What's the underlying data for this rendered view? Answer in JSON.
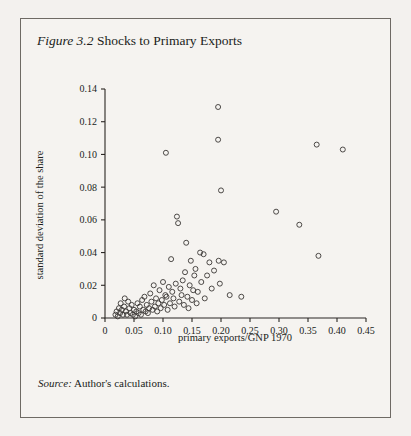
{
  "page": {
    "running_head": "",
    "background_color": "#f3f1ee"
  },
  "figure": {
    "number_label": "Figure 3.2",
    "caption": "Shocks to Primary Exports",
    "source_label": "Source:",
    "source_text": "Author's calculations.",
    "border_color": "#6e6a64",
    "panel_color": "#f5f3f0"
  },
  "chart_data": {
    "type": "scatter",
    "title": "Shocks to Primary Exports",
    "xlabel": "primary exports/GNP 1970",
    "ylabel": "standard deviation of the share",
    "xlim": [
      0,
      0.45
    ],
    "ylim": [
      0,
      0.14
    ],
    "xticks": [
      0,
      0.05,
      0.1,
      0.15,
      0.2,
      0.25,
      0.3,
      0.35,
      0.4,
      0.45
    ],
    "xtick_labels": [
      "0",
      "0.05",
      "0.10",
      "0.15",
      "0.20",
      "0.25",
      "0.30",
      "0.35",
      "0.40",
      "0.45"
    ],
    "yticks": [
      0,
      0.02,
      0.04,
      0.06,
      0.08,
      0.1,
      0.12,
      0.14
    ],
    "ytick_labels": [
      "0",
      "0.02",
      "0.04",
      "0.06",
      "0.08",
      "0.10",
      "0.12",
      "0.14"
    ],
    "grid": false,
    "legend": null,
    "marker": "open-circle",
    "marker_color": "#3a3734",
    "n_points": 91,
    "points": [
      [
        0.018,
        0.002
      ],
      [
        0.02,
        0.004
      ],
      [
        0.022,
        0.001
      ],
      [
        0.024,
        0.006
      ],
      [
        0.026,
        0.003
      ],
      [
        0.027,
        0.009
      ],
      [
        0.029,
        0.005
      ],
      [
        0.031,
        0.002
      ],
      [
        0.033,
        0.007
      ],
      [
        0.034,
        0.012
      ],
      [
        0.036,
        0.004
      ],
      [
        0.038,
        0.002
      ],
      [
        0.04,
        0.01
      ],
      [
        0.042,
        0.006
      ],
      [
        0.044,
        0.003
      ],
      [
        0.046,
        0.008
      ],
      [
        0.048,
        0.002
      ],
      [
        0.05,
        0.005
      ],
      [
        0.052,
        0.001
      ],
      [
        0.054,
        0.004
      ],
      [
        0.056,
        0.009
      ],
      [
        0.058,
        0.003
      ],
      [
        0.06,
        0.007
      ],
      [
        0.062,
        0.002
      ],
      [
        0.064,
        0.011
      ],
      [
        0.066,
        0.005
      ],
      [
        0.068,
        0.013
      ],
      [
        0.07,
        0.004
      ],
      [
        0.072,
        0.008
      ],
      [
        0.074,
        0.003
      ],
      [
        0.076,
        0.006
      ],
      [
        0.078,
        0.015
      ],
      [
        0.08,
        0.01
      ],
      [
        0.082,
        0.005
      ],
      [
        0.084,
        0.02
      ],
      [
        0.086,
        0.007
      ],
      [
        0.088,
        0.012
      ],
      [
        0.09,
        0.004
      ],
      [
        0.092,
        0.009
      ],
      [
        0.094,
        0.017
      ],
      [
        0.096,
        0.006
      ],
      [
        0.098,
        0.011
      ],
      [
        0.1,
        0.022
      ],
      [
        0.102,
        0.008
      ],
      [
        0.104,
        0.014
      ],
      [
        0.105,
        0.101
      ],
      [
        0.106,
        0.013
      ],
      [
        0.108,
        0.005
      ],
      [
        0.11,
        0.019
      ],
      [
        0.112,
        0.009
      ],
      [
        0.114,
        0.036
      ],
      [
        0.116,
        0.016
      ],
      [
        0.118,
        0.012
      ],
      [
        0.12,
        0.007
      ],
      [
        0.122,
        0.021
      ],
      [
        0.124,
        0.062
      ],
      [
        0.126,
        0.058
      ],
      [
        0.128,
        0.01
      ],
      [
        0.13,
        0.018
      ],
      [
        0.132,
        0.014
      ],
      [
        0.134,
        0.023
      ],
      [
        0.136,
        0.008
      ],
      [
        0.138,
        0.028
      ],
      [
        0.14,
        0.046
      ],
      [
        0.142,
        0.013
      ],
      [
        0.144,
        0.006
      ],
      [
        0.146,
        0.02
      ],
      [
        0.148,
        0.035
      ],
      [
        0.15,
        0.011
      ],
      [
        0.152,
        0.017
      ],
      [
        0.154,
        0.026
      ],
      [
        0.156,
        0.03
      ],
      [
        0.158,
        0.009
      ],
      [
        0.16,
        0.016
      ],
      [
        0.164,
        0.04
      ],
      [
        0.166,
        0.022
      ],
      [
        0.17,
        0.039
      ],
      [
        0.172,
        0.012
      ],
      [
        0.176,
        0.026
      ],
      [
        0.18,
        0.034
      ],
      [
        0.184,
        0.018
      ],
      [
        0.188,
        0.029
      ],
      [
        0.195,
        0.129
      ],
      [
        0.195,
        0.109
      ],
      [
        0.196,
        0.035
      ],
      [
        0.198,
        0.021
      ],
      [
        0.2,
        0.078
      ],
      [
        0.205,
        0.034
      ],
      [
        0.215,
        0.014
      ],
      [
        0.235,
        0.013
      ],
      [
        0.295,
        0.065
      ],
      [
        0.335,
        0.057
      ],
      [
        0.365,
        0.106
      ],
      [
        0.368,
        0.038
      ],
      [
        0.41,
        0.103
      ]
    ]
  }
}
